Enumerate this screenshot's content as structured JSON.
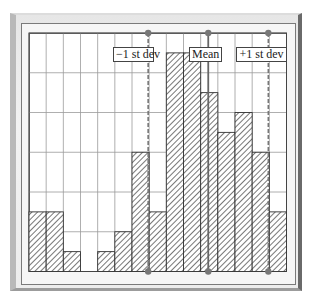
{
  "chart_data": {
    "type": "bar",
    "title": "",
    "xlabel": "",
    "ylabel": "",
    "grid": true,
    "grid_columns": 15,
    "grid_rows": 6,
    "ylim": [
      0,
      6
    ],
    "categories": [
      "1",
      "2",
      "3",
      "4",
      "5",
      "6",
      "7",
      "8",
      "9",
      "10",
      "11",
      "12",
      "13",
      "14",
      "15"
    ],
    "values": [
      1.5,
      1.5,
      0.5,
      0,
      0.5,
      1.0,
      3.0,
      1.5,
      5.5,
      5.5,
      4.5,
      3.5,
      4.0,
      3.0,
      1.5
    ],
    "bar_fill": "diagonal-hatch",
    "annotations": [
      {
        "label": "−1 st dev",
        "x_position_column": 7.0,
        "line_style": "dashed"
      },
      {
        "label": "Mean",
        "x_position_column": 10.5,
        "line_style": "solid"
      },
      {
        "label": "+1 st dev",
        "x_position_column": 14.0,
        "line_style": "dashed"
      }
    ]
  },
  "labels": {
    "minus_one_sd": "−1 st dev",
    "mean": "Mean",
    "plus_one_sd": "+1 st dev"
  },
  "colors": {
    "bar_outline": "#333333",
    "hatch": "#555555",
    "grid": "#9a9a9a",
    "marker": "#777777",
    "mean_line": "#666666"
  }
}
